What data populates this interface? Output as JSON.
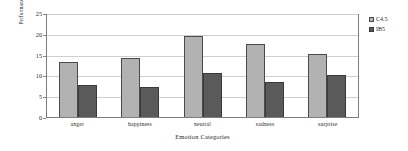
{
  "chart_data": {
    "type": "bar",
    "title": "",
    "xlabel": "Emotion Categories",
    "ylabel": "Performance Enhancement (%)",
    "categories": [
      "anger",
      "happiness",
      "neutral",
      "sadness",
      "surprise"
    ],
    "series": [
      {
        "name": "C4.5",
        "color": "#b2b2b2",
        "values": [
          13.3,
          14.1,
          19.5,
          17.5,
          15.2
        ]
      },
      {
        "name": "IB5",
        "color": "#5a5a5a",
        "values": [
          7.8,
          7.2,
          10.5,
          8.5,
          10.0
        ]
      }
    ],
    "ylim": [
      0,
      25
    ],
    "yticks": [
      0,
      5,
      10,
      15,
      20,
      25
    ],
    "grid": true,
    "legend_position": "right"
  }
}
